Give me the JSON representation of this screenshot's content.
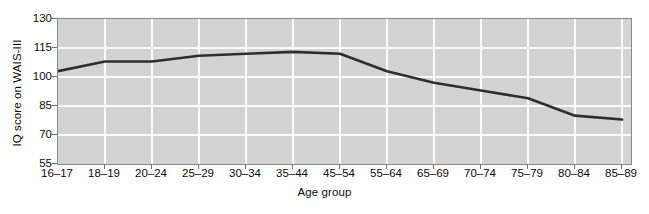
{
  "chart_data": {
    "type": "line",
    "title": "",
    "xlabel": "Age group",
    "ylabel": "IQ score on WAIS-III",
    "categories": [
      "16–17",
      "18–19",
      "20–24",
      "25–29",
      "30–34",
      "35–44",
      "45–54",
      "55–64",
      "65–69",
      "70–74",
      "75–79",
      "80–84",
      "85–89"
    ],
    "values": [
      103,
      108,
      108,
      111,
      112,
      113,
      112,
      103,
      97,
      93,
      89,
      80,
      78
    ],
    "series": [
      {
        "name": "IQ score on WAIS-III",
        "values": [
          103,
          108,
          108,
          111,
          112,
          113,
          112,
          103,
          97,
          93,
          89,
          80,
          78
        ]
      }
    ],
    "ylim": [
      55,
      130
    ],
    "yticks": [
      55,
      70,
      85,
      100,
      115,
      130
    ],
    "ytick_labels": [
      "55",
      "70",
      "85",
      "100",
      "115",
      "130"
    ],
    "grid": "horizontal-and-vertical",
    "legend": "none",
    "line_color": "#2e2e2e",
    "plot_background": "#d3d3d3",
    "gridline_color": "#fbfbfb",
    "axis_color": "#8a8a8a"
  }
}
